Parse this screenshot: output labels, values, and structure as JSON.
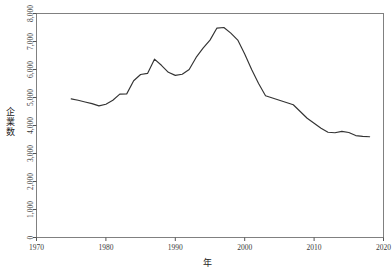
{
  "chart_data": {
    "type": "line",
    "title": "",
    "subtitle": "",
    "xlabel": "年",
    "ylabel": "企業数",
    "xlim": [
      1970,
      2020
    ],
    "ylim": [
      0,
      8000
    ],
    "xticks": [
      1970,
      1980,
      1990,
      2000,
      2010,
      2020
    ],
    "xtick_labels": [
      "1970",
      "1980",
      "1990",
      "2000",
      "2010",
      "2020"
    ],
    "yticks": [
      0,
      1000,
      2000,
      3000,
      4000,
      5000,
      6000,
      7000,
      8000
    ],
    "ytick_labels": [
      "0",
      "1,000",
      "2,000",
      "3,000",
      "4,000",
      "5,000",
      "6,000",
      "7,000",
      "8,000"
    ],
    "grid": false,
    "legend": null,
    "line_color": "#333333",
    "box_color": "#808080",
    "x": [
      1975,
      1976,
      1977,
      1978,
      1979,
      1980,
      1981,
      1982,
      1983,
      1984,
      1985,
      1986,
      1987,
      1988,
      1989,
      1990,
      1991,
      1992,
      1993,
      1994,
      1995,
      1996,
      1997,
      1998,
      1999,
      2000,
      2001,
      2002,
      2003,
      2004,
      2005,
      2006,
      2007,
      2008,
      2009,
      2010,
      2011,
      2012,
      2013,
      2014,
      2015,
      2016,
      2017,
      2018
    ],
    "values": [
      4950,
      4900,
      4840,
      4780,
      4700,
      4760,
      4900,
      5120,
      5130,
      5600,
      5820,
      5860,
      6370,
      6150,
      5900,
      5790,
      5830,
      6000,
      6430,
      6760,
      7050,
      7480,
      7500,
      7300,
      7050,
      6550,
      6000,
      5500,
      5060,
      4980,
      4900,
      4820,
      4740,
      4500,
      4260,
      4080,
      3900,
      3760,
      3740,
      3790,
      3750,
      3640,
      3610,
      3600
    ],
    "series_name": "企業数",
    "annotations": []
  },
  "axes": {
    "y_axis_name": "y-axis",
    "x_axis_name": "x-axis"
  }
}
